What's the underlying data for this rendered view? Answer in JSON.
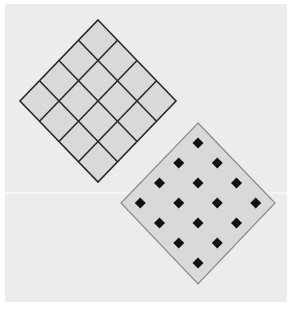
{
  "figure": {
    "colors": {
      "background": "#ececec",
      "tile_fill": "#d9d9d9",
      "grid_line": "#2a2a2a",
      "outline": "#8a8a8a",
      "dot": "#111111",
      "divider": "#ffffff"
    },
    "grid_diamond": {
      "rows": 4,
      "cols": 4,
      "top": [
        98,
        20
      ],
      "right": [
        176,
        101
      ],
      "bottom": [
        98,
        182
      ],
      "left": [
        20,
        101
      ]
    },
    "dot_diamond": {
      "rows": 4,
      "cols": 4,
      "dot_count": 16,
      "top": [
        198,
        123
      ],
      "right": [
        275,
        203
      ],
      "bottom": [
        198,
        284
      ],
      "left": [
        121,
        203
      ]
    },
    "divider_y": 193
  }
}
